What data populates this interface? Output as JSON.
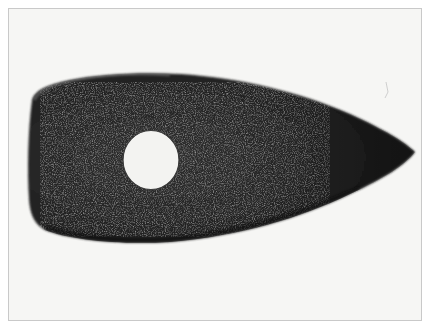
{
  "image": {
    "subject": "perforated stone tool (adze/axe head) with drilled shaft hole",
    "alt": "Dark stone wedge-shaped tool with a round hole, photographed on a white background",
    "colors": {
      "background": "#f6f6f4",
      "frame_border": "#c9c9c9",
      "stone_dark": "#1c1c1c",
      "stone_mid": "#2e2e2e",
      "speckle": "#6a6a6a",
      "hole": "#f3f3f1"
    }
  }
}
